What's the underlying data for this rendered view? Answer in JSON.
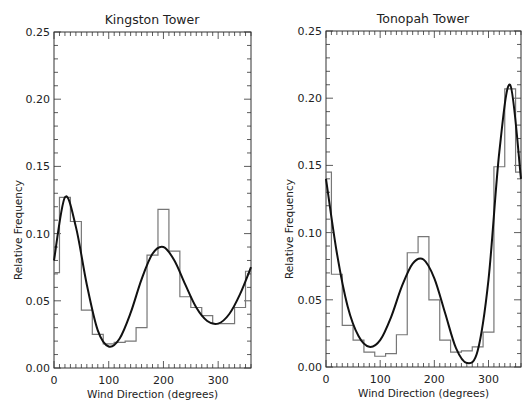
{
  "chart_data": [
    {
      "type": "bar",
      "title": "Kingston Tower",
      "xlabel": "Wind Direction (degrees)",
      "ylabel": "Relative Frequency",
      "xlim": [
        0,
        360
      ],
      "ylim": [
        0,
        0.25
      ],
      "xticks": [
        "0",
        "100",
        "200",
        "300"
      ],
      "yticks": [
        "0.00",
        "0.05",
        "0.10",
        "0.15",
        "0.20",
        "0.25"
      ],
      "grid": false,
      "legend": null,
      "bin_width_deg": 20,
      "categories": [
        0,
        20,
        40,
        60,
        80,
        100,
        120,
        140,
        160,
        180,
        200,
        220,
        240,
        260,
        280,
        300,
        320,
        340,
        360
      ],
      "series": [
        {
          "name": "histogram",
          "style": "step",
          "values": [
            0.071,
            0.127,
            0.109,
            0.043,
            0.025,
            0.018,
            0.019,
            0.02,
            0.03,
            0.084,
            0.118,
            0.087,
            0.053,
            0.045,
            0.039,
            0.033,
            0.033,
            0.045,
            0.072
          ]
        },
        {
          "name": "fitted curve",
          "style": "line",
          "x": [
            0,
            20,
            40,
            60,
            80,
            100,
            120,
            140,
            160,
            180,
            200,
            220,
            240,
            260,
            280,
            300,
            320,
            340,
            360
          ],
          "values": [
            0.08,
            0.127,
            0.105,
            0.062,
            0.028,
            0.016,
            0.022,
            0.041,
            0.066,
            0.085,
            0.09,
            0.08,
            0.062,
            0.045,
            0.035,
            0.033,
            0.04,
            0.055,
            0.075
          ]
        }
      ]
    },
    {
      "type": "bar",
      "title": "Tonopah Tower",
      "xlabel": "Wind Direction (degrees)",
      "ylabel": "Relative Frequency",
      "xlim": [
        0,
        360
      ],
      "ylim": [
        0,
        0.25
      ],
      "xticks": [
        "0",
        "100",
        "200",
        "300"
      ],
      "yticks": [
        "0.00",
        "0.05",
        "0.10",
        "0.15",
        "0.20",
        "0.25"
      ],
      "grid": false,
      "legend": null,
      "bin_width_deg": 20,
      "categories": [
        0,
        20,
        40,
        60,
        80,
        100,
        120,
        140,
        160,
        180,
        200,
        220,
        240,
        260,
        280,
        300,
        320,
        340,
        360
      ],
      "series": [
        {
          "name": "histogram",
          "style": "step",
          "values": [
            0.145,
            0.069,
            0.031,
            0.02,
            0.011,
            0.008,
            0.01,
            0.024,
            0.085,
            0.097,
            0.05,
            0.02,
            0.011,
            0.012,
            0.015,
            0.026,
            0.149,
            0.207,
            0.145
          ]
        },
        {
          "name": "fitted curve",
          "style": "line",
          "x": [
            0,
            20,
            40,
            60,
            80,
            100,
            120,
            140,
            160,
            180,
            200,
            220,
            240,
            260,
            280,
            300,
            320,
            340,
            360
          ],
          "values": [
            0.14,
            0.085,
            0.045,
            0.023,
            0.015,
            0.02,
            0.037,
            0.06,
            0.077,
            0.08,
            0.066,
            0.04,
            0.014,
            0.003,
            0.012,
            0.065,
            0.16,
            0.21,
            0.14
          ]
        }
      ]
    }
  ]
}
